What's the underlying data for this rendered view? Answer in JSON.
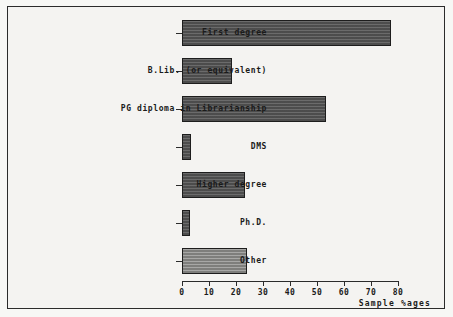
{
  "chart_data": {
    "type": "bar",
    "orientation": "horizontal",
    "title": "",
    "xlabel": "Sample %ages",
    "ylabel": "",
    "xlim": [
      0,
      80
    ],
    "grid": false,
    "legend": null,
    "xticks": [
      "0",
      "10",
      "20",
      "30",
      "40",
      "50",
      "60",
      "70",
      "80"
    ],
    "xtick_values": [
      0,
      10,
      20,
      30,
      40,
      50,
      60,
      70,
      80
    ],
    "categories": [
      "First degree",
      "B.Lib. (or equivalent)",
      "PG diploma in Librarianship",
      "DMS",
      "Higher degree",
      "Ph.D.",
      "Other"
    ],
    "values": [
      77.5,
      18.5,
      53.5,
      3.5,
      23.5,
      3,
      24
    ],
    "bar_styles": [
      "dark",
      "dark",
      "dark",
      "dark",
      "dark",
      "dark",
      "light"
    ],
    "colors": {
      "bar_dark": "#555555",
      "bar_light": "#8a8a88",
      "bar_edge": "#1d1d1d",
      "axis": "#2b2b2b",
      "text": "#1a1a1a",
      "background": "#f4f3f1",
      "frame": "#2b2b2b"
    }
  }
}
